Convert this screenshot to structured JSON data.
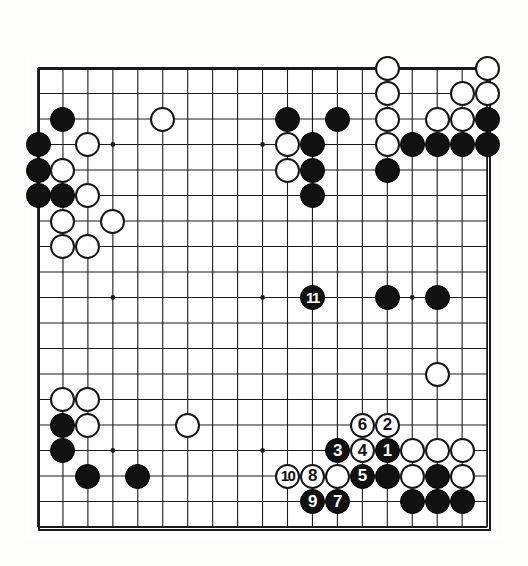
{
  "diagram": {
    "type": "go-board",
    "board_size": 19,
    "colors": {
      "black_stone": "#111111",
      "white_stone": "#ffffff",
      "line": "#1a1a1a",
      "background": "#ffffff"
    },
    "geometry": {
      "origin_x": 38,
      "origin_y": 68,
      "spacing_x": 24.95,
      "spacing_y": 25.5,
      "stone_diameter": 25
    },
    "star_points": [
      {
        "col": 4,
        "row": 4
      },
      {
        "col": 10,
        "row": 4
      },
      {
        "col": 16,
        "row": 4
      },
      {
        "col": 4,
        "row": 10
      },
      {
        "col": 10,
        "row": 10
      },
      {
        "col": 16,
        "row": 10
      },
      {
        "col": 4,
        "row": 16
      },
      {
        "col": 10,
        "row": 16
      },
      {
        "col": 16,
        "row": 16
      }
    ],
    "stones": [
      {
        "col": 15,
        "row": 1,
        "color": "white",
        "label": ""
      },
      {
        "col": 19,
        "row": 1,
        "color": "white",
        "label": ""
      },
      {
        "col": 2,
        "row": 3,
        "color": "black",
        "label": ""
      },
      {
        "col": 6,
        "row": 3,
        "color": "white",
        "label": ""
      },
      {
        "col": 11,
        "row": 3,
        "color": "black",
        "label": ""
      },
      {
        "col": 13,
        "row": 3,
        "color": "black",
        "label": ""
      },
      {
        "col": 15,
        "row": 2,
        "color": "white",
        "label": ""
      },
      {
        "col": 18,
        "row": 2,
        "color": "white",
        "label": ""
      },
      {
        "col": 19,
        "row": 2,
        "color": "white",
        "label": ""
      },
      {
        "col": 15,
        "row": 3,
        "color": "white",
        "label": ""
      },
      {
        "col": 17,
        "row": 3,
        "color": "white",
        "label": ""
      },
      {
        "col": 18,
        "row": 3,
        "color": "white",
        "label": ""
      },
      {
        "col": 19,
        "row": 3,
        "color": "black",
        "label": ""
      },
      {
        "col": 1,
        "row": 4,
        "color": "black",
        "label": ""
      },
      {
        "col": 3,
        "row": 4,
        "color": "white",
        "label": ""
      },
      {
        "col": 11,
        "row": 4,
        "color": "white",
        "label": ""
      },
      {
        "col": 12,
        "row": 4,
        "color": "black",
        "label": ""
      },
      {
        "col": 15,
        "row": 4,
        "color": "white",
        "label": ""
      },
      {
        "col": 16,
        "row": 4,
        "color": "black",
        "label": ""
      },
      {
        "col": 17,
        "row": 4,
        "color": "black",
        "label": ""
      },
      {
        "col": 18,
        "row": 4,
        "color": "black",
        "label": ""
      },
      {
        "col": 19,
        "row": 4,
        "color": "black",
        "label": ""
      },
      {
        "col": 1,
        "row": 5,
        "color": "black",
        "label": ""
      },
      {
        "col": 2,
        "row": 5,
        "color": "white",
        "label": ""
      },
      {
        "col": 11,
        "row": 5,
        "color": "white",
        "label": ""
      },
      {
        "col": 12,
        "row": 5,
        "color": "black",
        "label": ""
      },
      {
        "col": 15,
        "row": 5,
        "color": "black",
        "label": ""
      },
      {
        "col": 1,
        "row": 6,
        "color": "black",
        "label": ""
      },
      {
        "col": 2,
        "row": 6,
        "color": "black",
        "label": ""
      },
      {
        "col": 3,
        "row": 6,
        "color": "white",
        "label": ""
      },
      {
        "col": 12,
        "row": 6,
        "color": "black",
        "label": ""
      },
      {
        "col": 2,
        "row": 7,
        "color": "white",
        "label": ""
      },
      {
        "col": 4,
        "row": 7,
        "color": "white",
        "label": ""
      },
      {
        "col": 2,
        "row": 8,
        "color": "white",
        "label": ""
      },
      {
        "col": 3,
        "row": 8,
        "color": "white",
        "label": ""
      },
      {
        "col": 12,
        "row": 10,
        "color": "black",
        "label": "11"
      },
      {
        "col": 15,
        "row": 10,
        "color": "black",
        "label": ""
      },
      {
        "col": 17,
        "row": 10,
        "color": "black",
        "label": ""
      },
      {
        "col": 17,
        "row": 13,
        "color": "white",
        "label": ""
      },
      {
        "col": 2,
        "row": 14,
        "color": "white",
        "label": ""
      },
      {
        "col": 3,
        "row": 14,
        "color": "white",
        "label": ""
      },
      {
        "col": 2,
        "row": 15,
        "color": "black",
        "label": ""
      },
      {
        "col": 3,
        "row": 15,
        "color": "white",
        "label": ""
      },
      {
        "col": 7,
        "row": 15,
        "color": "white",
        "label": ""
      },
      {
        "col": 14,
        "row": 15,
        "color": "white",
        "label": "6"
      },
      {
        "col": 15,
        "row": 15,
        "color": "white",
        "label": "2"
      },
      {
        "col": 2,
        "row": 16,
        "color": "black",
        "label": ""
      },
      {
        "col": 13,
        "row": 16,
        "color": "black",
        "label": "3"
      },
      {
        "col": 14,
        "row": 16,
        "color": "white",
        "label": "4"
      },
      {
        "col": 15,
        "row": 16,
        "color": "black",
        "label": "1"
      },
      {
        "col": 16,
        "row": 16,
        "color": "white",
        "label": ""
      },
      {
        "col": 17,
        "row": 16,
        "color": "white",
        "label": ""
      },
      {
        "col": 18,
        "row": 16,
        "color": "white",
        "label": ""
      },
      {
        "col": 3,
        "row": 17,
        "color": "black",
        "label": ""
      },
      {
        "col": 5,
        "row": 17,
        "color": "black",
        "label": ""
      },
      {
        "col": 11,
        "row": 17,
        "color": "white",
        "label": "10"
      },
      {
        "col": 12,
        "row": 17,
        "color": "white",
        "label": "8"
      },
      {
        "col": 13,
        "row": 17,
        "color": "white",
        "label": ""
      },
      {
        "col": 14,
        "row": 17,
        "color": "black",
        "label": "5"
      },
      {
        "col": 15,
        "row": 17,
        "color": "black",
        "label": ""
      },
      {
        "col": 16,
        "row": 17,
        "color": "white",
        "label": ""
      },
      {
        "col": 17,
        "row": 17,
        "color": "black",
        "label": ""
      },
      {
        "col": 18,
        "row": 17,
        "color": "white",
        "label": ""
      },
      {
        "col": 12,
        "row": 18,
        "color": "black",
        "label": "9"
      },
      {
        "col": 13,
        "row": 18,
        "color": "black",
        "label": "7"
      },
      {
        "col": 16,
        "row": 18,
        "color": "black",
        "label": ""
      },
      {
        "col": 17,
        "row": 18,
        "color": "black",
        "label": ""
      },
      {
        "col": 18,
        "row": 18,
        "color": "black",
        "label": ""
      }
    ],
    "move_sequence": [
      {
        "n": "1",
        "color": "black",
        "col": 15,
        "row": 16
      },
      {
        "n": "2",
        "color": "white",
        "col": 15,
        "row": 15
      },
      {
        "n": "3",
        "color": "black",
        "col": 13,
        "row": 16
      },
      {
        "n": "4",
        "color": "white",
        "col": 14,
        "row": 16
      },
      {
        "n": "5",
        "color": "black",
        "col": 14,
        "row": 17
      },
      {
        "n": "6",
        "color": "white",
        "col": 14,
        "row": 15
      },
      {
        "n": "7",
        "color": "black",
        "col": 13,
        "row": 18
      },
      {
        "n": "8",
        "color": "white",
        "col": 12,
        "row": 17
      },
      {
        "n": "9",
        "color": "black",
        "col": 12,
        "row": 18
      },
      {
        "n": "10",
        "color": "white",
        "col": 11,
        "row": 17
      },
      {
        "n": "11",
        "color": "black",
        "col": 12,
        "row": 10
      }
    ]
  }
}
